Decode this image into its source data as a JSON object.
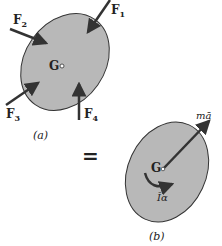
{
  "figure_a": {
    "caption": "(a)",
    "center_label": "G",
    "forces": [
      {
        "label": "F",
        "sub": "1"
      },
      {
        "label": "F",
        "sub": "2"
      },
      {
        "label": "F",
        "sub": "3"
      },
      {
        "label": "F",
        "sub": "4"
      }
    ]
  },
  "equals": "=",
  "figure_b": {
    "caption": "(b)",
    "center_label": "G",
    "linear_label": "mā",
    "angular_label": "Īα"
  },
  "colors": {
    "body_fill": "#b8b8b8",
    "body_stroke": "#333333",
    "arrow": "#333333"
  }
}
